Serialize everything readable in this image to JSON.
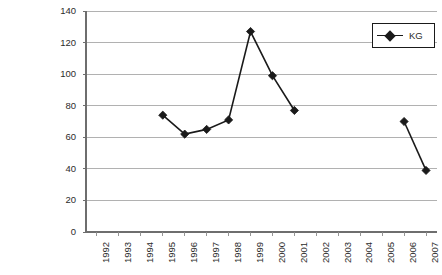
{
  "chart_title": "",
  "legend": {
    "position": "top-right",
    "entries": [
      {
        "label": "KG",
        "marker": "diamond-marker-icon",
        "color": "#1a1a1a"
      }
    ]
  },
  "axes": {
    "y": {
      "label": "",
      "min": 0,
      "max": 140,
      "step": 20,
      "ticks": [
        "0",
        "20",
        "40",
        "60",
        "80",
        "100",
        "120",
        "140"
      ],
      "grid": true
    },
    "x": {
      "label": "",
      "ticks": [
        "1992",
        "1993",
        "1994",
        "1995",
        "1996",
        "1997",
        "1998",
        "1999",
        "2000",
        "2001",
        "2002",
        "2003",
        "2004",
        "2005",
        "2006",
        "2007"
      ],
      "grid": false,
      "tick_rotation": "-90"
    }
  },
  "chart_data": {
    "type": "line",
    "title": "",
    "xlabel": "",
    "ylabel": "",
    "ylim": [
      0,
      140
    ],
    "ytick_step": 20,
    "grid": true,
    "legend_position": "top-right",
    "categories": [
      "1992",
      "1993",
      "1994",
      "1995",
      "1996",
      "1997",
      "1998",
      "1999",
      "2000",
      "2001",
      "2002",
      "2003",
      "2004",
      "2005",
      "2006",
      "2007"
    ],
    "series": [
      {
        "name": "KG",
        "color": "#1a1a1a",
        "marker": "diamond",
        "values": [
          null,
          null,
          null,
          74,
          62,
          65,
          71,
          127,
          99,
          77,
          null,
          null,
          null,
          null,
          70,
          39
        ]
      }
    ]
  },
  "plot_geometry": {
    "left": 86,
    "right": 437,
    "top": 11,
    "bottom": 232
  }
}
